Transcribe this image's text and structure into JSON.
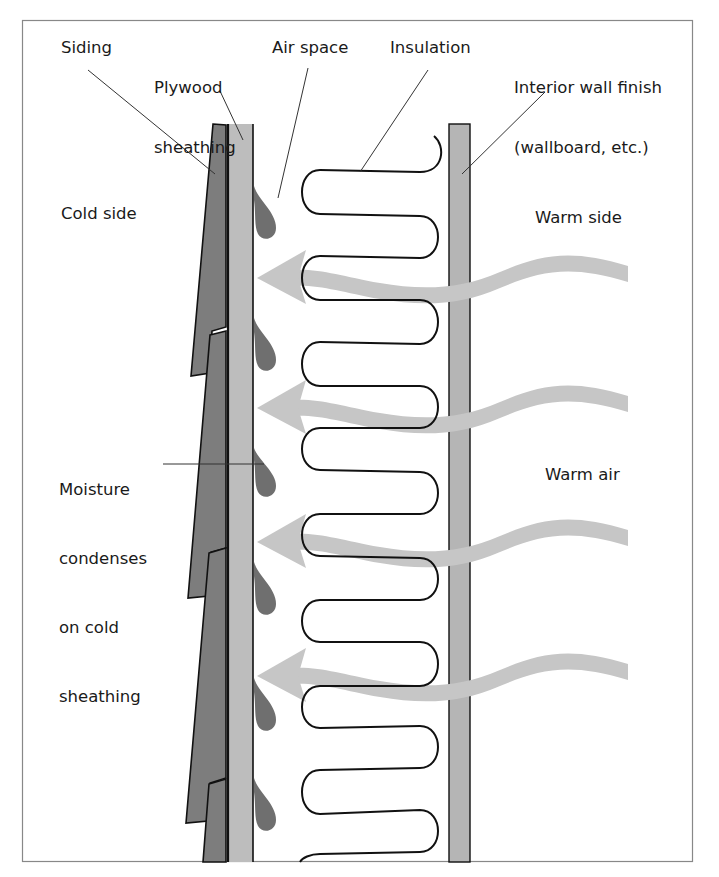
{
  "labels": {
    "siding": "Siding",
    "plywood_line1": "Plywood",
    "plywood_line2": "sheathing",
    "air_space": "Air space",
    "insulation": "Insulation",
    "interior_line1": "Interior wall finish",
    "interior_line2": "(wallboard, etc.)",
    "cold_side": "Cold side",
    "warm_side": "Warm side",
    "warm_air": "Warm air",
    "moisture_line1": "Moisture",
    "moisture_line2": "condenses",
    "moisture_line3": "on cold",
    "moisture_line4": "sheathing"
  },
  "colors": {
    "siding": "#7a7a7a",
    "sheathing": "#bdbdbd",
    "wallboard": "#b5b5b5",
    "droplet": "#707070",
    "arrow": "#c4c4c4",
    "outline": "#111111",
    "frame": "#888888"
  },
  "arrows_count": 4,
  "droplets_count": 6
}
